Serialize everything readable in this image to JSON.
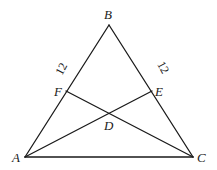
{
  "diagram": {
    "type": "triangle-geometry",
    "points": {
      "A": {
        "label": "A",
        "x": 25,
        "y": 157
      },
      "B": {
        "label": "B",
        "x": 109,
        "y": 25
      },
      "C": {
        "label": "C",
        "x": 193,
        "y": 157
      },
      "D": {
        "label": "D",
        "x": 109,
        "y": 113
      },
      "E": {
        "label": "E",
        "x": 152,
        "y": 91
      },
      "F": {
        "label": "F",
        "x": 66,
        "y": 91
      }
    },
    "segments": [
      {
        "from": "A",
        "to": "B"
      },
      {
        "from": "B",
        "to": "C"
      },
      {
        "from": "A",
        "to": "C"
      },
      {
        "from": "A",
        "to": "E"
      },
      {
        "from": "C",
        "to": "F"
      }
    ],
    "measurements": {
      "BF": "12",
      "BE": "12"
    },
    "line_color": "#1a1a1a",
    "background": "#ffffff"
  }
}
